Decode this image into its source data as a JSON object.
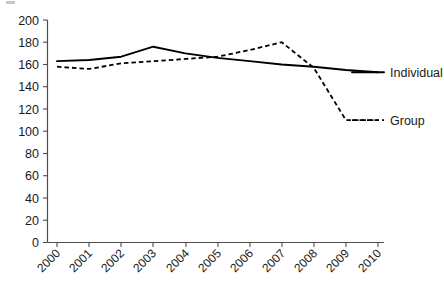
{
  "chart_data": {
    "type": "line",
    "title": "",
    "subtitle": "",
    "xlabel": "",
    "ylabel": "",
    "categories": [
      "2000",
      "2001",
      "2002",
      "2003",
      "2004",
      "2005",
      "2006",
      "2007",
      "2008",
      "2009",
      "2010"
    ],
    "x": [
      2000,
      2001,
      2002,
      2003,
      2004,
      2005,
      2006,
      2007,
      2008,
      2009,
      2010
    ],
    "series": [
      {
        "name": "Individual",
        "style": "solid",
        "color": "#000000",
        "values": [
          163,
          164,
          167,
          176,
          170,
          166,
          163,
          160,
          158,
          155,
          153
        ]
      },
      {
        "name": "Group",
        "style": "dashed",
        "color": "#000000",
        "values": [
          158,
          156,
          161,
          163,
          165,
          167,
          173,
          180,
          157,
          110,
          110
        ]
      }
    ],
    "ylim": [
      0,
      200
    ],
    "ytick_labels": [
      "200",
      "180",
      "160",
      "140",
      "120",
      "100",
      "80",
      "60",
      "40",
      "20",
      "0"
    ],
    "ytick_values": [
      200,
      180,
      160,
      140,
      120,
      100,
      80,
      60,
      40,
      20,
      0
    ],
    "ytick_step": 20,
    "xlim": [
      2000,
      2010
    ],
    "grid": false,
    "legend_position": "right-inline",
    "legend": [
      {
        "label": "Individual",
        "style": "solid",
        "at_value": 153
      },
      {
        "label": "Group",
        "style": "dashed",
        "at_value": 110
      }
    ],
    "axis_color": "#4d4d4d",
    "xtick_rotation_deg": -45
  },
  "legend_labels": {
    "individual": "Individual",
    "group": "Group"
  }
}
